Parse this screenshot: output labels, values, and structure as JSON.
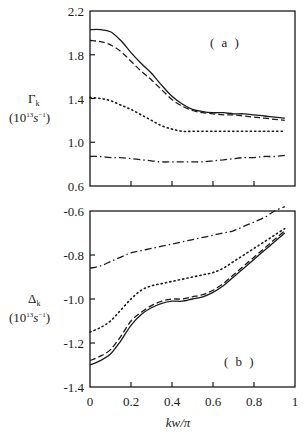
{
  "chart_data": [
    {
      "type": "line",
      "panel_label": "( a )",
      "title": "",
      "xlabel": "",
      "ylabel": "Γk",
      "ylabel_units": "(10^13 s^-1)",
      "ylim": [
        0.6,
        2.2
      ],
      "xlim": [
        0,
        1
      ],
      "yticks": [
        0.6,
        1.0,
        1.4,
        1.8,
        2.2
      ],
      "ytick_labels": [
        "0.6",
        "1.0",
        "1.4",
        "1.8",
        "2.2"
      ],
      "xticks": [
        0,
        0.2,
        0.4,
        0.6,
        0.8,
        1
      ],
      "xtick_labels": [],
      "grid": false,
      "legend": null,
      "x": [
        0.0,
        0.05,
        0.1,
        0.15,
        0.2,
        0.25,
        0.3,
        0.35,
        0.4,
        0.45,
        0.5,
        0.55,
        0.6,
        0.65,
        0.7,
        0.75,
        0.8,
        0.85,
        0.9,
        0.95
      ],
      "series": [
        {
          "name": "solid",
          "style": "solid",
          "values": [
            2.03,
            2.03,
            2.01,
            1.93,
            1.82,
            1.72,
            1.63,
            1.52,
            1.42,
            1.35,
            1.3,
            1.28,
            1.27,
            1.27,
            1.26,
            1.26,
            1.25,
            1.24,
            1.23,
            1.22
          ]
        },
        {
          "name": "dashed",
          "style": "dashed",
          "values": [
            1.93,
            1.92,
            1.89,
            1.83,
            1.74,
            1.65,
            1.57,
            1.48,
            1.39,
            1.33,
            1.29,
            1.27,
            1.26,
            1.25,
            1.25,
            1.24,
            1.23,
            1.22,
            1.21,
            1.2
          ]
        },
        {
          "name": "dotted",
          "style": "dotted",
          "values": [
            1.41,
            1.4,
            1.38,
            1.34,
            1.3,
            1.25,
            1.2,
            1.15,
            1.12,
            1.1,
            1.1,
            1.1,
            1.1,
            1.1,
            1.1,
            1.1,
            1.1,
            1.1,
            1.1,
            1.1
          ]
        },
        {
          "name": "dash-dot",
          "style": "dashdot",
          "values": [
            0.87,
            0.87,
            0.86,
            0.86,
            0.85,
            0.84,
            0.83,
            0.82,
            0.82,
            0.82,
            0.82,
            0.82,
            0.83,
            0.84,
            0.85,
            0.86,
            0.86,
            0.87,
            0.87,
            0.88
          ]
        }
      ]
    },
    {
      "type": "line",
      "panel_label": "( b )",
      "title": "",
      "xlabel": "kw/π",
      "ylabel": "Δk",
      "ylabel_units": "(10^13 s^-1)",
      "ylim": [
        -1.4,
        -0.6
      ],
      "xlim": [
        0,
        1
      ],
      "yticks": [
        -1.4,
        -1.2,
        -1.0,
        -0.8,
        -0.6
      ],
      "ytick_labels": [
        "-1.4",
        "-1.2",
        "-1.0",
        "-0.8",
        "-0.6"
      ],
      "xticks": [
        0,
        0.2,
        0.4,
        0.6,
        0.8,
        1
      ],
      "xtick_labels": [
        "0",
        "0.2",
        "0.4",
        "0.6",
        "0.8",
        "1"
      ],
      "grid": false,
      "legend": null,
      "x": [
        0.0,
        0.05,
        0.1,
        0.15,
        0.2,
        0.25,
        0.3,
        0.35,
        0.4,
        0.45,
        0.5,
        0.55,
        0.6,
        0.65,
        0.7,
        0.75,
        0.8,
        0.85,
        0.9,
        0.95
      ],
      "series": [
        {
          "name": "solid",
          "style": "solid",
          "values": [
            -1.3,
            -1.28,
            -1.25,
            -1.19,
            -1.12,
            -1.07,
            -1.04,
            -1.02,
            -1.01,
            -1.01,
            -1.0,
            -0.99,
            -0.97,
            -0.94,
            -0.9,
            -0.86,
            -0.82,
            -0.78,
            -0.74,
            -0.7
          ]
        },
        {
          "name": "dashed",
          "style": "dashed",
          "values": [
            -1.28,
            -1.26,
            -1.23,
            -1.17,
            -1.1,
            -1.06,
            -1.03,
            -1.01,
            -1.0,
            -1.0,
            -0.99,
            -0.98,
            -0.96,
            -0.93,
            -0.89,
            -0.85,
            -0.81,
            -0.77,
            -0.73,
            -0.69
          ]
        },
        {
          "name": "dotted",
          "style": "dotted",
          "values": [
            -1.15,
            -1.13,
            -1.1,
            -1.05,
            -1.0,
            -0.96,
            -0.94,
            -0.93,
            -0.92,
            -0.91,
            -0.9,
            -0.89,
            -0.88,
            -0.86,
            -0.83,
            -0.8,
            -0.77,
            -0.74,
            -0.71,
            -0.68
          ]
        },
        {
          "name": "dash-dot",
          "style": "dashdot",
          "values": [
            -0.86,
            -0.85,
            -0.83,
            -0.81,
            -0.79,
            -0.78,
            -0.77,
            -0.76,
            -0.75,
            -0.74,
            -0.73,
            -0.72,
            -0.71,
            -0.7,
            -0.69,
            -0.67,
            -0.65,
            -0.63,
            -0.6,
            -0.58
          ]
        }
      ]
    }
  ],
  "labels": {
    "panel_a": {
      "ylabel_symbol": "Γ",
      "ylabel_sub": "k",
      "ylabel_units_base": "(10",
      "ylabel_units_exp": "13",
      "ylabel_units_s": "s",
      "ylabel_units_sexp": "−1",
      "ylabel_units_close": ")",
      "panel_tag": "( a )",
      "yticks": [
        "2.2",
        "1.8",
        "1.4",
        "1.0",
        "0.6"
      ]
    },
    "panel_b": {
      "ylabel_symbol": "Δ",
      "ylabel_sub": "k",
      "ylabel_units_base": "(10",
      "ylabel_units_exp": "13",
      "ylabel_units_s": "s",
      "ylabel_units_sexp": "−1",
      "ylabel_units_close": ")",
      "panel_tag": "( b )",
      "yticks": [
        "-0.6",
        "-0.8",
        "-1.0",
        "-1.2",
        "-1.4"
      ],
      "xticks": [
        "0",
        "0.2",
        "0.4",
        "0.6",
        "0.8",
        "1"
      ]
    },
    "xlabel": "kw/π"
  }
}
